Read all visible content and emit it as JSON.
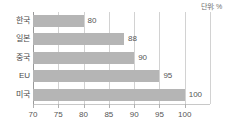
{
  "unit_note": "단위: %",
  "chart_data": {
    "type": "bar",
    "orientation": "horizontal",
    "title": "",
    "subtitle": "",
    "xlabel": "",
    "ylabel": "",
    "categories": [
      "한국",
      "일본",
      "중국",
      "EU",
      "미국"
    ],
    "values": [
      80,
      88,
      90,
      95,
      100
    ],
    "data_labels": [
      "80",
      "88",
      "90",
      "95",
      "100"
    ],
    "xlim": [
      70,
      105
    ],
    "xticks": [
      70,
      75,
      80,
      85,
      90,
      95,
      100
    ],
    "xtick_labels": [
      "70",
      "75",
      "80",
      "85",
      "90",
      "95",
      "100"
    ],
    "grid": true,
    "legend": false,
    "unit": "%",
    "bar_color": "#b5b5b5",
    "gridline_color": "#d2d2d2",
    "axis_color": "#9a9a9a",
    "text_color": "#4a4a4a"
  }
}
